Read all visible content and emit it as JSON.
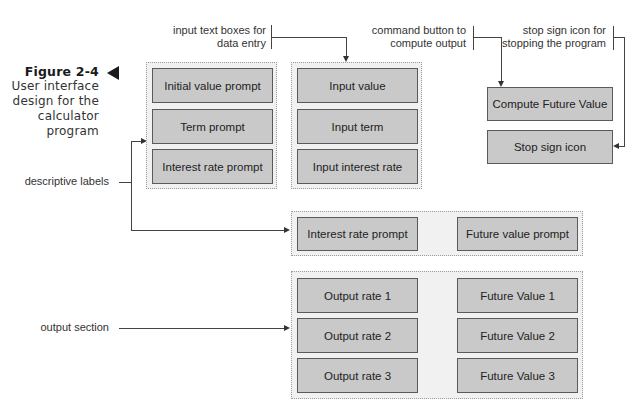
{
  "figure": {
    "number": "Figure 2-4",
    "caption_lines": [
      "User interface",
      "design for the",
      "calculator",
      "program"
    ]
  },
  "annotations": {
    "input_boxes": [
      "input text boxes for",
      "data entry"
    ],
    "command_button": [
      "command button to",
      "compute output"
    ],
    "stop_icon": [
      "stop sign icon for",
      "stopping the program"
    ],
    "descriptive_labels": "descriptive labels",
    "output_section": "output section"
  },
  "label_group": {
    "items": [
      "Initial value prompt",
      "Term prompt",
      "Interest rate prompt"
    ]
  },
  "input_group": {
    "items": [
      "Input value",
      "Input term",
      "Input interest rate"
    ]
  },
  "buttons": {
    "compute": "Compute Future Value",
    "stop": "Stop sign icon"
  },
  "header_row": {
    "left": "Interest rate prompt",
    "right": "Future value prompt"
  },
  "output_group": {
    "rates": [
      "Output rate 1",
      "Output rate 2",
      "Output rate 3"
    ],
    "values": [
      "Future Value 1",
      "Future Value 2",
      "Future Value 3"
    ]
  },
  "colors": {
    "box_fill": "#c9c9c9",
    "box_border": "#5a5a5a",
    "group_fill": "#f1f1f1",
    "group_border": "#9a9a9a",
    "line": "#444444"
  }
}
